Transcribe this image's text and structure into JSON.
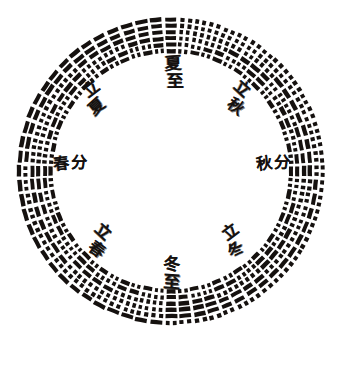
{
  "figure": {
    "background_color": "#ffffff",
    "ink_color": "#15110f",
    "canvas": {
      "width": 350,
      "height": 391
    }
  },
  "ring": {
    "center_x": 171,
    "center_y": 171,
    "outer_radius": 155,
    "inner_radius": 117,
    "hexagram_count": 64,
    "lines_per_hexagram": 6,
    "line_order": "innermost band is line 1 (bottom line), outermost band is line 6 (top line)",
    "yang_style": "solid bar",
    "yin_style": "broken bar with central gap",
    "band_gap_ratio": 0.34,
    "segment_angular_width_deg": 4.35
  },
  "season_labels": [
    {
      "id": "summer-solstice",
      "name": "summer-solstice-label",
      "chars": [
        "夏",
        "至"
      ],
      "romanization": "Xiazhi",
      "english": "Summer Solstice",
      "position": "top",
      "angle_deg": 90,
      "layout": "vertical",
      "x": 163,
      "y": 55,
      "font_size": 17,
      "rotate": -3
    },
    {
      "id": "start-of-autumn",
      "name": "start-of-autumn-label",
      "chars": [
        "立",
        "秋"
      ],
      "romanization": "Liqiu",
      "english": "Beginning of Autumn",
      "position": "upper-right",
      "angle_deg": 45,
      "layout": "diagonal",
      "x": 227,
      "y": 79,
      "font_size": 16,
      "rotate": 40
    },
    {
      "id": "autumn-equinox",
      "name": "autumn-equinox-label",
      "chars": [
        "秋",
        "分"
      ],
      "romanization": "Qiufen",
      "english": "Autumn Equinox",
      "position": "right",
      "angle_deg": 0,
      "layout": "horizontal",
      "x": 256,
      "y": 155,
      "font_size": 16,
      "rotate": -4
    },
    {
      "id": "start-of-winter",
      "name": "start-of-winter-label",
      "chars": [
        "立",
        "冬"
      ],
      "romanization": "Lidong",
      "english": "Beginning of Winter",
      "position": "lower-right",
      "angle_deg": -45,
      "layout": "diagonal",
      "x": 225,
      "y": 222,
      "font_size": 16,
      "rotate": -40
    },
    {
      "id": "winter-solstice",
      "name": "winter-solstice-label",
      "chars": [
        "冬",
        "至"
      ],
      "romanization": "Dongzhi",
      "english": "Winter Solstice",
      "position": "bottom",
      "angle_deg": 270,
      "layout": "vertical",
      "x": 161,
      "y": 256,
      "font_size": 17,
      "rotate": 2
    },
    {
      "id": "start-of-spring",
      "name": "start-of-spring-label",
      "chars": [
        "立",
        "春"
      ],
      "romanization": "Lichun",
      "english": "Beginning of Spring",
      "position": "lower-left",
      "angle_deg": 225,
      "layout": "diagonal",
      "x": 88,
      "y": 222,
      "font_size": 16,
      "rotate": 40
    },
    {
      "id": "spring-equinox",
      "name": "spring-equinox-label",
      "chars": [
        "春",
        "分"
      ],
      "romanization": "Chunfen",
      "english": "Spring Equinox",
      "position": "left",
      "angle_deg": 180,
      "layout": "horizontal",
      "x": 53,
      "y": 155,
      "font_size": 16,
      "rotate": -3
    },
    {
      "id": "start-of-summer",
      "name": "start-of-summer-label",
      "chars": [
        "立",
        "夏"
      ],
      "romanization": "Lixia",
      "english": "Beginning of Summer",
      "position": "upper-left",
      "angle_deg": 135,
      "layout": "diagonal",
      "x": 86,
      "y": 79,
      "font_size": 16,
      "rotate": -40
    }
  ],
  "chart_data": {
    "type": "pie",
    "subtitle": "Xiantian (Before-Heaven) order with eight solar-term markers",
    "categories": [
      "夏至",
      "立秋",
      "秋分",
      "立冬",
      "冬至",
      "立春",
      "春分",
      "立夏"
    ],
    "values": [
      8,
      8,
      8,
      8,
      8,
      8,
      8,
      8
    ],
    "xlabel": "",
    "ylabel": "",
    "legend_position": "none",
    "grid": false,
    "hexagrams": [
      {
        "i": 1,
        "lines": [
          1,
          1,
          1,
          1,
          1,
          1
        ]
      },
      {
        "i": 2,
        "lines": [
          0,
          1,
          1,
          1,
          1,
          1
        ]
      },
      {
        "i": 3,
        "lines": [
          1,
          0,
          1,
          1,
          1,
          1
        ]
      },
      {
        "i": 4,
        "lines": [
          0,
          0,
          1,
          1,
          1,
          1
        ]
      },
      {
        "i": 5,
        "lines": [
          1,
          1,
          0,
          1,
          1,
          1
        ]
      },
      {
        "i": 6,
        "lines": [
          0,
          1,
          0,
          1,
          1,
          1
        ]
      },
      {
        "i": 7,
        "lines": [
          1,
          0,
          0,
          1,
          1,
          1
        ]
      },
      {
        "i": 8,
        "lines": [
          0,
          0,
          0,
          1,
          1,
          1
        ]
      },
      {
        "i": 9,
        "lines": [
          1,
          1,
          1,
          0,
          1,
          1
        ]
      },
      {
        "i": 10,
        "lines": [
          0,
          1,
          1,
          0,
          1,
          1
        ]
      },
      {
        "i": 11,
        "lines": [
          1,
          0,
          1,
          0,
          1,
          1
        ]
      },
      {
        "i": 12,
        "lines": [
          0,
          0,
          1,
          0,
          1,
          1
        ]
      },
      {
        "i": 13,
        "lines": [
          1,
          1,
          0,
          0,
          1,
          1
        ]
      },
      {
        "i": 14,
        "lines": [
          0,
          1,
          0,
          0,
          1,
          1
        ]
      },
      {
        "i": 15,
        "lines": [
          1,
          0,
          0,
          0,
          1,
          1
        ]
      },
      {
        "i": 16,
        "lines": [
          0,
          0,
          0,
          0,
          1,
          1
        ]
      },
      {
        "i": 17,
        "lines": [
          1,
          1,
          1,
          1,
          0,
          1
        ]
      },
      {
        "i": 18,
        "lines": [
          0,
          1,
          1,
          1,
          0,
          1
        ]
      },
      {
        "i": 19,
        "lines": [
          1,
          0,
          1,
          1,
          0,
          1
        ]
      },
      {
        "i": 20,
        "lines": [
          0,
          0,
          1,
          1,
          0,
          1
        ]
      },
      {
        "i": 21,
        "lines": [
          1,
          1,
          0,
          1,
          0,
          1
        ]
      },
      {
        "i": 22,
        "lines": [
          0,
          1,
          0,
          1,
          0,
          1
        ]
      },
      {
        "i": 23,
        "lines": [
          1,
          0,
          0,
          1,
          0,
          1
        ]
      },
      {
        "i": 24,
        "lines": [
          0,
          0,
          0,
          1,
          0,
          1
        ]
      },
      {
        "i": 25,
        "lines": [
          1,
          1,
          1,
          0,
          0,
          1
        ]
      },
      {
        "i": 26,
        "lines": [
          0,
          1,
          1,
          0,
          0,
          1
        ]
      },
      {
        "i": 27,
        "lines": [
          1,
          0,
          1,
          0,
          0,
          1
        ]
      },
      {
        "i": 28,
        "lines": [
          0,
          0,
          1,
          0,
          0,
          1
        ]
      },
      {
        "i": 29,
        "lines": [
          1,
          1,
          0,
          0,
          0,
          1
        ]
      },
      {
        "i": 30,
        "lines": [
          0,
          1,
          0,
          0,
          0,
          1
        ]
      },
      {
        "i": 31,
        "lines": [
          1,
          0,
          0,
          0,
          0,
          1
        ]
      },
      {
        "i": 32,
        "lines": [
          0,
          0,
          0,
          0,
          0,
          1
        ]
      },
      {
        "i": 33,
        "lines": [
          1,
          1,
          1,
          1,
          1,
          0
        ]
      },
      {
        "i": 34,
        "lines": [
          0,
          1,
          1,
          1,
          1,
          0
        ]
      },
      {
        "i": 35,
        "lines": [
          1,
          0,
          1,
          1,
          1,
          0
        ]
      },
      {
        "i": 36,
        "lines": [
          0,
          0,
          1,
          1,
          1,
          0
        ]
      },
      {
        "i": 37,
        "lines": [
          1,
          1,
          0,
          1,
          1,
          0
        ]
      },
      {
        "i": 38,
        "lines": [
          0,
          1,
          0,
          1,
          1,
          0
        ]
      },
      {
        "i": 39,
        "lines": [
          1,
          0,
          0,
          1,
          1,
          0
        ]
      },
      {
        "i": 40,
        "lines": [
          0,
          0,
          0,
          1,
          1,
          0
        ]
      },
      {
        "i": 41,
        "lines": [
          1,
          1,
          1,
          0,
          1,
          0
        ]
      },
      {
        "i": 42,
        "lines": [
          0,
          1,
          1,
          0,
          1,
          0
        ]
      },
      {
        "i": 43,
        "lines": [
          1,
          0,
          1,
          0,
          1,
          0
        ]
      },
      {
        "i": 44,
        "lines": [
          0,
          0,
          1,
          0,
          1,
          0
        ]
      },
      {
        "i": 45,
        "lines": [
          1,
          1,
          0,
          0,
          1,
          0
        ]
      },
      {
        "i": 46,
        "lines": [
          0,
          1,
          0,
          0,
          1,
          0
        ]
      },
      {
        "i": 47,
        "lines": [
          1,
          0,
          0,
          0,
          1,
          0
        ]
      },
      {
        "i": 48,
        "lines": [
          0,
          0,
          0,
          0,
          1,
          0
        ]
      },
      {
        "i": 49,
        "lines": [
          1,
          1,
          1,
          1,
          0,
          0
        ]
      },
      {
        "i": 50,
        "lines": [
          0,
          1,
          1,
          1,
          0,
          0
        ]
      },
      {
        "i": 51,
        "lines": [
          1,
          0,
          1,
          1,
          0,
          0
        ]
      },
      {
        "i": 52,
        "lines": [
          0,
          0,
          1,
          1,
          0,
          0
        ]
      },
      {
        "i": 53,
        "lines": [
          1,
          1,
          0,
          1,
          0,
          0
        ]
      },
      {
        "i": 54,
        "lines": [
          0,
          1,
          0,
          1,
          0,
          0
        ]
      },
      {
        "i": 55,
        "lines": [
          1,
          0,
          0,
          1,
          0,
          0
        ]
      },
      {
        "i": 56,
        "lines": [
          0,
          0,
          0,
          1,
          0,
          0
        ]
      },
      {
        "i": 57,
        "lines": [
          1,
          1,
          1,
          0,
          0,
          0
        ]
      },
      {
        "i": 58,
        "lines": [
          0,
          1,
          1,
          0,
          0,
          0
        ]
      },
      {
        "i": 59,
        "lines": [
          1,
          0,
          1,
          0,
          0,
          0
        ]
      },
      {
        "i": 60,
        "lines": [
          0,
          0,
          1,
          0,
          0,
          0
        ]
      },
      {
        "i": 61,
        "lines": [
          1,
          1,
          0,
          0,
          0,
          0
        ]
      },
      {
        "i": 62,
        "lines": [
          0,
          1,
          0,
          0,
          0,
          0
        ]
      },
      {
        "i": 63,
        "lines": [
          1,
          0,
          0,
          0,
          0,
          0
        ]
      },
      {
        "i": 64,
        "lines": [
          0,
          0,
          0,
          0,
          0,
          0
        ]
      }
    ]
  }
}
